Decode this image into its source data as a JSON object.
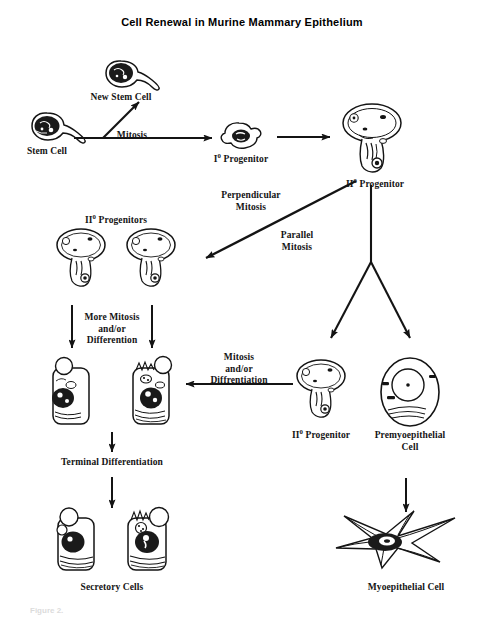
{
  "figure": {
    "title": "Cell Renewal in Murine Mammary Epithelium",
    "caption": "Figure 2.",
    "ink_color": "#141414",
    "background_color": "#ffffff"
  },
  "nodes": {
    "new_stem_cell": "New Stem Cell",
    "stem_cell": "Stem Cell",
    "primary_progenitor": "I",
    "primary_progenitor_sup": "0",
    "primary_progenitor_tail": " Progenitor",
    "secondary_progenitor_top": "II",
    "secondary_progenitor_top_sup": "0",
    "secondary_progenitor_top_tail": " Progenitor",
    "secondary_progenitors_left": "II",
    "secondary_progenitors_left_sup": "0",
    "secondary_progenitors_left_tail": " Progenitors",
    "secondary_progenitor_bottom": "II",
    "secondary_progenitor_bottom_sup": "0",
    "secondary_progenitor_bottom_tail": " Progenitor",
    "premyoepithelial_cell": "Premyoepithelial\nCell",
    "myoepithelial_cell": "Myoepithelial Cell",
    "secretory_cells": "Secretory Cells"
  },
  "edges": {
    "mitosis": "Mitosis",
    "perpendicular_mitosis": "Perpendicular\nMitosis",
    "parallel_mitosis": "Parallel\nMitosis",
    "more_mitosis_differention": "More Mitosis\nand/or\nDifferention",
    "mitosis_diffrentiation": "Mitosis\nand/or\nDiffrentiation",
    "terminal_differentiation": "Terminal Differentiation"
  }
}
